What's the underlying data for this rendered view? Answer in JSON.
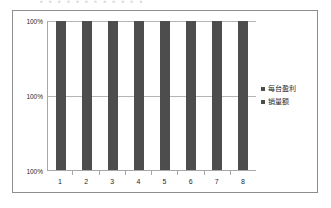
{
  "page": {
    "background_color": "#ffffff",
    "top_cropped_text": "▪ ▪ ▪ ▪ ▪ ▪ ▪ ▪ ▪ ▪ ▪ ▪"
  },
  "chart_frame": {
    "border_color": "#8d8d8d"
  },
  "legend": {
    "position": "right",
    "items": [
      {
        "label": "每台盈利",
        "color": "#4d4d4d",
        "marker": "square-marker"
      },
      {
        "label": "销量额",
        "color": "#4d4d4d",
        "marker": "square-marker"
      }
    ]
  },
  "axes": {
    "y_labels": [
      "100%",
      "100%",
      "100%"
    ],
    "x_labels": [
      "1",
      "2",
      "3",
      "4",
      "5",
      "6",
      "7",
      "8"
    ],
    "gridline_color": "#b4b4b4",
    "axis_color": "#a8a8a8"
  },
  "chart_data": {
    "type": "bar",
    "title": "",
    "xlabel": "",
    "ylabel": "",
    "categories": [
      "1",
      "2",
      "3",
      "4",
      "5",
      "6",
      "7",
      "8"
    ],
    "series": [
      {
        "name": "每台盈利",
        "values": [
          100,
          100,
          100,
          100,
          100,
          100,
          100,
          100
        ],
        "color": "#4d4d4d"
      },
      {
        "name": "销量额",
        "values": [
          100,
          100,
          100,
          100,
          100,
          100,
          100,
          100
        ],
        "color": "#4d4d4d"
      }
    ],
    "ytick_labels": [
      "100%",
      "100%",
      "100%"
    ],
    "ylim": [
      100,
      100
    ],
    "grid": true,
    "legend_position": "right",
    "note": "All bars render at full plot height; every y-axis tick is labeled 100%."
  }
}
